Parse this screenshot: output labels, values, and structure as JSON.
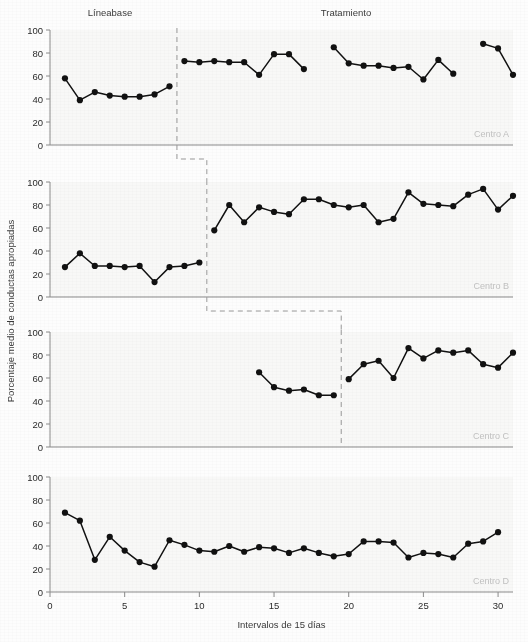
{
  "figure": {
    "phase_labels": [
      {
        "text": "Líneabase",
        "x": 110,
        "y": 16
      },
      {
        "text": "Tratamiento",
        "x": 346,
        "y": 16
      }
    ],
    "y_axis_title": "Porcentaje medio de conductas apropiadas",
    "x_axis_title": "Intervalos de 15 días",
    "y_ticks": [
      "0",
      "20",
      "40",
      "60",
      "80",
      "100"
    ],
    "x_ticks": [
      "0",
      "5",
      "10",
      "15",
      "20",
      "25",
      "30"
    ],
    "panel_tags": [
      "Centro A",
      "Centro B",
      "Centro C",
      "Centro D"
    ],
    "accent_color": "#111111",
    "axis_color": "#8a8a8a",
    "tag_color": "#c2c2c2",
    "divider_color": "#9a9a9a"
  },
  "chart_data": {
    "type": "line",
    "title": "",
    "subtitle": "",
    "xlabel": "Intervalos de 15 días",
    "ylabel": "Porcentaje medio de conductas apropiadas",
    "xlim": [
      0,
      31
    ],
    "ylim": [
      0,
      100
    ],
    "xticks": [
      0,
      5,
      10,
      15,
      20,
      25,
      30
    ],
    "yticks": [
      0,
      20,
      40,
      60,
      80,
      100
    ],
    "grid": false,
    "legend": "none",
    "design": "multiple-baseline across settings",
    "phases": [
      "Líneabase",
      "Tratamiento"
    ],
    "annotations": [
      {
        "text": "Líneabase",
        "phase": "baseline"
      },
      {
        "text": "Tratamiento",
        "phase": "treatment"
      }
    ],
    "panels": [
      {
        "name": "Centro A",
        "intervention_x": 8.5,
        "baseline": {
          "x": [
            1,
            2,
            3,
            4,
            5,
            6,
            7,
            8
          ],
          "y": [
            58,
            39,
            46,
            43,
            42,
            42,
            44,
            51
          ]
        },
        "treatment_segments": [
          {
            "x": [
              9,
              10,
              11,
              12,
              13,
              14,
              15,
              16,
              17
            ],
            "y": [
              73,
              72,
              73,
              72,
              72,
              61,
              79,
              79,
              66
            ]
          },
          {
            "x": [
              19,
              20,
              21,
              22,
              23,
              24,
              25,
              26,
              27
            ],
            "y": [
              85,
              71,
              69,
              69,
              67,
              68,
              57,
              74,
              62
            ]
          },
          {
            "x": [
              29,
              30,
              31
            ],
            "y": [
              88,
              84,
              61
            ]
          }
        ]
      },
      {
        "name": "Centro B",
        "intervention_x": 10.5,
        "baseline": {
          "x": [
            1,
            2,
            3,
            4,
            5,
            6,
            7,
            8,
            9,
            10
          ],
          "y": [
            26,
            38,
            27,
            27,
            26,
            27,
            13,
            26,
            27,
            30
          ]
        },
        "treatment_segments": [
          {
            "x": [
              11,
              12,
              13,
              14,
              15,
              16,
              17,
              18,
              19,
              20,
              21,
              22,
              23,
              24,
              25,
              26,
              27,
              28,
              29,
              30,
              31
            ],
            "y": [
              58,
              80,
              65,
              78,
              74,
              72,
              85,
              85,
              80,
              78,
              80,
              65,
              68,
              91,
              81,
              80,
              79,
              89,
              94,
              76,
              88
            ]
          }
        ]
      },
      {
        "name": "Centro C",
        "intervention_x": 19.5,
        "baseline": {
          "x": [
            14,
            15,
            16,
            17,
            18,
            19
          ],
          "y": [
            65,
            52,
            49,
            50,
            45,
            45
          ]
        },
        "treatment_segments": [
          {
            "x": [
              20,
              21,
              22,
              23,
              24,
              25,
              26,
              27,
              28,
              29,
              30,
              31
            ],
            "y": [
              59,
              72,
              75,
              60,
              86,
              77,
              84,
              82,
              84,
              72,
              69,
              82
            ]
          }
        ]
      },
      {
        "name": "Centro D",
        "intervention_x": null,
        "baseline": {
          "x": [
            1,
            2,
            3,
            4,
            5,
            6,
            7,
            8,
            9,
            10,
            11,
            12,
            13,
            14,
            15,
            16,
            17,
            18,
            19,
            20,
            21,
            22,
            23,
            24,
            25,
            26,
            27,
            28,
            29,
            30
          ],
          "y": [
            69,
            62,
            28,
            48,
            36,
            26,
            22,
            45,
            41,
            36,
            35,
            40,
            35,
            39,
            38,
            34,
            38,
            34,
            31,
            33,
            44,
            44,
            43,
            30,
            34,
            33,
            30,
            42,
            44,
            52
          ]
        },
        "treatment_segments": []
      }
    ]
  }
}
